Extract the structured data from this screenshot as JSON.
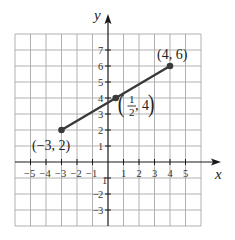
{
  "axes": {
    "x_label": "x",
    "y_label": "y",
    "x_tick_labels": [
      {
        "value": -5,
        "text": "−5"
      },
      {
        "value": -4,
        "text": "−4"
      },
      {
        "value": -3,
        "text": "−3"
      },
      {
        "value": -2,
        "text": "−2"
      },
      {
        "value": -1,
        "text": "−1"
      },
      {
        "value": 1,
        "text": "1"
      },
      {
        "value": 2,
        "text": "2"
      },
      {
        "value": 3,
        "text": "3"
      },
      {
        "value": 4,
        "text": "4"
      },
      {
        "value": 5,
        "text": "5"
      }
    ],
    "y_tick_labels": [
      {
        "value": 7,
        "text": "7"
      },
      {
        "value": 6,
        "text": "6"
      },
      {
        "value": 5,
        "text": "5"
      },
      {
        "value": 4,
        "text": "4"
      },
      {
        "value": 3,
        "text": "3"
      },
      {
        "value": 2,
        "text": "2"
      },
      {
        "value": 1,
        "text": "1"
      },
      {
        "value": -1,
        "text": "1"
      },
      {
        "value": -2,
        "text": "2"
      },
      {
        "value": -3,
        "text": "3"
      }
    ]
  },
  "points": [
    {
      "x": -3,
      "y": 2,
      "label": "(−3, 2)"
    },
    {
      "x": 0.5,
      "y": 4,
      "label_open": "(",
      "label_num": "1",
      "label_den": "2",
      "label_rest": ", 4",
      "label_close": ")"
    },
    {
      "x": 4,
      "y": 6,
      "label": "(4, 6)"
    }
  ],
  "segment": {
    "from": [
      -3,
      2
    ],
    "to": [
      4,
      6
    ]
  },
  "colors": {
    "grid": "#a8a8a8",
    "axis": "#1a1a1a",
    "segment": "#3a3a3a"
  }
}
